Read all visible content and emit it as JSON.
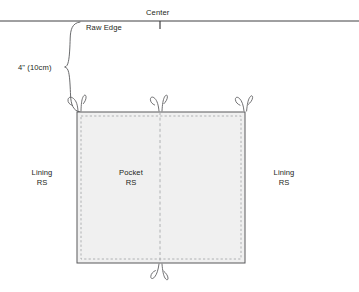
{
  "diagram": {
    "labels": {
      "center": "Center",
      "raw_edge": "Raw Edge",
      "dimension": "4\" (10cm)",
      "pocket_line1": "Pocket",
      "pocket_line2": "RS",
      "lining_left_line1": "Lining",
      "lining_left_line2": "RS",
      "lining_right_line1": "Lining",
      "lining_right_line2": "RS"
    },
    "colors": {
      "line": "#58595b",
      "rule": "#414042",
      "fabric_fill": "#f0f0f0",
      "stitch": "#a7a9ac",
      "text": "#231f20",
      "background": "#ffffff"
    },
    "geometry": {
      "raw_edge_y": 21,
      "fabric_left": 77,
      "fabric_right": 245,
      "fabric_top": 112,
      "fabric_bottom": 263,
      "center_x": 160,
      "stitch_inset": 4,
      "brace_top": 22,
      "brace_bottom": 112,
      "brace_tip_x": 65
    }
  }
}
